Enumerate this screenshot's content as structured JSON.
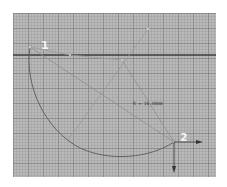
{
  "viewport": {
    "background": "#b9b9b9",
    "grid": {
      "minor_spacing_px": 3,
      "major_spacing_px": 15
    }
  },
  "points": [
    {
      "id": "1",
      "label": "1"
    },
    {
      "id": "2",
      "label": "2"
    }
  ],
  "dimension": {
    "label": "R = 16.00mm"
  },
  "colors": {
    "axis_line": "#3a3f44",
    "construction_line": "#8c8c8c",
    "arc": "#5a5a5a",
    "label": "#f4f4f4",
    "arrow": "#333333"
  }
}
